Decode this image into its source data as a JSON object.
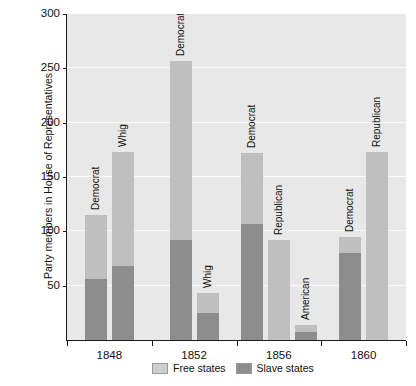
{
  "chart_data": {
    "type": "bar",
    "title": "",
    "subtitle": "",
    "xlabel": "",
    "ylabel": "Party members in House of Representatives",
    "ylim": [
      0,
      300
    ],
    "yticks": [
      50,
      100,
      150,
      200,
      250,
      300
    ],
    "grid": true,
    "stacked": true,
    "legend_position": "bottom",
    "legend": [
      "Free states",
      "Slave states"
    ],
    "categories": [
      "1848",
      "1852",
      "1856",
      "1860"
    ],
    "colors": {
      "free_states": "#bfbfbf",
      "slave_states": "#8d8d8d",
      "plot_background": "#e8e8e8",
      "gridline": "#fafafa",
      "axis": "#1a1a1a",
      "text": "#111111",
      "figure_background": "#ffffff"
    },
    "groups": [
      {
        "category": "1848",
        "bars": [
          {
            "label": "Democrat",
            "total": 115,
            "free_states": 59,
            "slave_states": 56
          },
          {
            "label": "Whig",
            "total": 173,
            "free_states": 105,
            "slave_states": 68
          }
        ]
      },
      {
        "category": "1852",
        "bars": [
          {
            "label": "Democrat",
            "total": 257,
            "free_states": 165,
            "slave_states": 92
          },
          {
            "label": "Whig",
            "total": 43,
            "free_states": 18,
            "slave_states": 25
          }
        ]
      },
      {
        "category": "1856",
        "bars": [
          {
            "label": "Democrat",
            "total": 172,
            "free_states": 65,
            "slave_states": 107
          },
          {
            "label": "Republican",
            "total": 92,
            "free_states": 92,
            "slave_states": 0
          },
          {
            "label": "American",
            "total": 14,
            "free_states": 7,
            "slave_states": 7
          }
        ]
      },
      {
        "category": "1860",
        "bars": [
          {
            "label": "Democrat",
            "total": 95,
            "free_states": 15,
            "slave_states": 80
          },
          {
            "label": "Republican",
            "total": 173,
            "free_states": 173,
            "slave_states": 0
          }
        ]
      }
    ]
  },
  "legend": {
    "items": [
      {
        "name": "free-states",
        "label": "Free states",
        "color": "#bfbfbf"
      },
      {
        "name": "slave-states",
        "label": "Slave states",
        "color": "#8d8d8d"
      }
    ]
  }
}
